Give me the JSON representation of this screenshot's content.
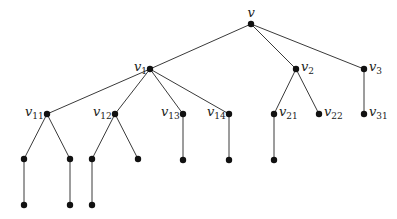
{
  "diagram": {
    "type": "rooted-tree",
    "nodes": [
      {
        "id": "v",
        "label": "v",
        "sub": "",
        "x": 251,
        "y": 24,
        "label_pos": "above"
      },
      {
        "id": "v1",
        "label": "v",
        "sub": "1",
        "x": 150,
        "y": 69,
        "label_pos": "left"
      },
      {
        "id": "v2",
        "label": "v",
        "sub": "2",
        "x": 296,
        "y": 69,
        "label_pos": "right"
      },
      {
        "id": "v3",
        "label": "v",
        "sub": "3",
        "x": 364,
        "y": 69,
        "label_pos": "right"
      },
      {
        "id": "v11",
        "label": "v",
        "sub": "11",
        "x": 47,
        "y": 114,
        "label_pos": "left"
      },
      {
        "id": "v12",
        "label": "v",
        "sub": "12",
        "x": 115,
        "y": 114,
        "label_pos": "left"
      },
      {
        "id": "v13",
        "label": "v",
        "sub": "13",
        "x": 183,
        "y": 114,
        "label_pos": "left"
      },
      {
        "id": "v14",
        "label": "v",
        "sub": "14",
        "x": 229,
        "y": 114,
        "label_pos": "left"
      },
      {
        "id": "v21",
        "label": "v",
        "sub": "21",
        "x": 274,
        "y": 114,
        "label_pos": "right"
      },
      {
        "id": "v22",
        "label": "v",
        "sub": "22",
        "x": 319,
        "y": 114,
        "label_pos": "right"
      },
      {
        "id": "v31",
        "label": "v",
        "sub": "31",
        "x": 364,
        "y": 114,
        "label_pos": "right"
      },
      {
        "id": "a1",
        "label": "",
        "sub": "",
        "x": 24,
        "y": 159
      },
      {
        "id": "a2",
        "label": "",
        "sub": "",
        "x": 70,
        "y": 159
      },
      {
        "id": "a3",
        "label": "",
        "sub": "",
        "x": 92,
        "y": 159
      },
      {
        "id": "a4",
        "label": "",
        "sub": "",
        "x": 138,
        "y": 159
      },
      {
        "id": "a5",
        "label": "",
        "sub": "",
        "x": 183,
        "y": 160
      },
      {
        "id": "a6",
        "label": "",
        "sub": "",
        "x": 229,
        "y": 160
      },
      {
        "id": "a7",
        "label": "",
        "sub": "",
        "x": 274,
        "y": 160
      },
      {
        "id": "b1",
        "label": "",
        "sub": "",
        "x": 24,
        "y": 205
      },
      {
        "id": "b2",
        "label": "",
        "sub": "",
        "x": 70,
        "y": 205
      },
      {
        "id": "b3",
        "label": "",
        "sub": "",
        "x": 92,
        "y": 205
      }
    ],
    "edges": [
      [
        "v",
        "v1"
      ],
      [
        "v",
        "v2"
      ],
      [
        "v",
        "v3"
      ],
      [
        "v1",
        "v11"
      ],
      [
        "v1",
        "v12"
      ],
      [
        "v1",
        "v13"
      ],
      [
        "v1",
        "v14"
      ],
      [
        "v2",
        "v21"
      ],
      [
        "v2",
        "v22"
      ],
      [
        "v3",
        "v31"
      ],
      [
        "v11",
        "a1"
      ],
      [
        "v11",
        "a2"
      ],
      [
        "v12",
        "a3"
      ],
      [
        "v12",
        "a4"
      ],
      [
        "v13",
        "a5"
      ],
      [
        "v14",
        "a6"
      ],
      [
        "v21",
        "a7"
      ],
      [
        "a1",
        "b1"
      ],
      [
        "a2",
        "b2"
      ],
      [
        "a3",
        "b3"
      ]
    ],
    "colors": {
      "edge": "#3a3a3a",
      "node": "#111111",
      "label": "#222222"
    }
  }
}
